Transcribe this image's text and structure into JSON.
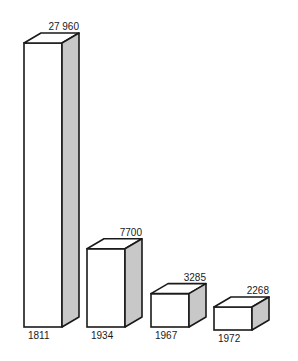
{
  "chart_data": {
    "type": "bar",
    "style": "3d-box",
    "title": "",
    "xlabel": "",
    "ylabel": "",
    "categories": [
      "1811",
      "1934",
      "1967",
      "1972"
    ],
    "values": [
      27960,
      7700,
      3285,
      2268
    ],
    "value_labels": [
      "27 960",
      "7700",
      "3285",
      "2268"
    ],
    "grid": false,
    "legend": null
  },
  "colors": {
    "front_face": "#ffffff",
    "top_face": "#ffffff",
    "side_face": "#c8c8c8",
    "outline": "#1a1a1a",
    "text": "#1a1a1a"
  }
}
